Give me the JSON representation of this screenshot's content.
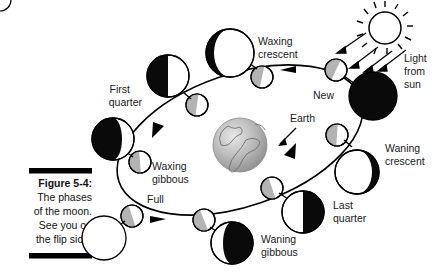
{
  "figure": {
    "caption_label": "Figure 5-4:",
    "caption_lines": [
      "The phases",
      "of the moon.",
      "See you on",
      "the flip side!"
    ]
  },
  "diagram": {
    "title": "The phases of the moon",
    "center_body_label": "Earth",
    "sun_label_lines": [
      "Light",
      "from",
      "sun"
    ],
    "background_color": "#ffffff",
    "ink_color": "#000000",
    "lit_color": "#ffffff",
    "dark_color": "#000000",
    "orbit_ball_shade": "#b0b0b0",
    "earth_color": "#9a9a9a"
  },
  "phases": [
    {
      "name": "New",
      "lit": "none",
      "order": 1
    },
    {
      "name": "Waxing crescent",
      "lit": "crescent-right",
      "order": 2
    },
    {
      "name": "First quarter",
      "lit": "right-half",
      "order": 3
    },
    {
      "name": "Waxing gibbous",
      "lit": "gibbous-right",
      "order": 4
    },
    {
      "name": "Full",
      "lit": "full",
      "order": 5
    },
    {
      "name": "Waning gibbous",
      "lit": "gibbous-left",
      "order": 6
    },
    {
      "name": "Last quarter",
      "lit": "left-half",
      "order": 7
    },
    {
      "name": "Waning crescent",
      "lit": "crescent-left",
      "order": 8
    }
  ],
  "labels": {
    "new": "New",
    "waxing_crescent_l1": "Waxing",
    "waxing_crescent_l2": "crescent",
    "first_quarter_l1": "First",
    "first_quarter_l2": "quarter",
    "waxing_gibbous_l1": "Waxing",
    "waxing_gibbous_l2": "gibbous",
    "full": "Full",
    "waning_gibbous_l1": "Waning",
    "waning_gibbous_l2": "gibbous",
    "last_quarter_l1": "Last",
    "last_quarter_l2": "quarter",
    "waning_crescent_l1": "Waning",
    "waning_crescent_l2": "crescent",
    "earth": "Earth",
    "sun_l1": "Light",
    "sun_l2": "from",
    "sun_l3": "sun"
  }
}
